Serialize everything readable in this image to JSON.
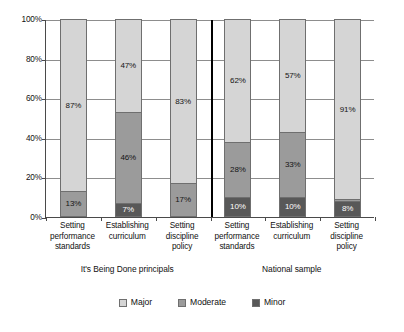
{
  "chart_data": {
    "type": "bar",
    "subtype": "stacked-100-percent",
    "title": "",
    "xlabel": "",
    "ylabel": "",
    "ylim": [
      0,
      100
    ],
    "ytick_labels": [
      "0%",
      "20%",
      "40%",
      "60%",
      "80%",
      "100%"
    ],
    "ytick_values": [
      0,
      20,
      40,
      60,
      80,
      100
    ],
    "grid": true,
    "legend_position": "bottom-center",
    "categories": [
      "Setting performance standards",
      "Establishing curriculum",
      "Setting discipline policy",
      "Setting performance standards",
      "Establishing curriculum",
      "Setting discipline policy"
    ],
    "groups": [
      {
        "label": "It's Being Done principals",
        "categories": [
          "Setting performance standards",
          "Establishing curriculum",
          "Setting discipline policy"
        ]
      },
      {
        "label": "National sample",
        "categories": [
          "Setting performance standards",
          "Establishing curriculum",
          "Setting discipline policy"
        ]
      }
    ],
    "series": [
      {
        "name": "Major",
        "color": "#d5d5d5",
        "values": [
          87,
          47,
          83,
          62,
          57,
          91
        ],
        "labels": [
          "87%",
          "47%",
          "83%",
          "62%",
          "57%",
          "91%"
        ]
      },
      {
        "name": "Moderate",
        "color": "#9b9b9b",
        "values": [
          13,
          46,
          17,
          28,
          33,
          1
        ],
        "labels": [
          "13%",
          "46%",
          "17%",
          "28%",
          "33%",
          ""
        ]
      },
      {
        "name": "Minor",
        "color": "#585858",
        "values": [
          0,
          7,
          0,
          10,
          10,
          8
        ],
        "labels": [
          "",
          "7%",
          "",
          "10%",
          "10%",
          "8%"
        ]
      }
    ],
    "legend": [
      {
        "label": "Major",
        "color": "#d5d5d5"
      },
      {
        "label": "Moderate",
        "color": "#9b9b9b"
      },
      {
        "label": "Minor",
        "color": "#585858"
      }
    ],
    "bars": [
      {
        "group": "It's Being Done principals",
        "category_lines": [
          "Setting",
          "performance",
          "standards"
        ],
        "segments": [
          {
            "series": "Minor",
            "value": 0,
            "label": ""
          },
          {
            "series": "Moderate",
            "value": 13,
            "label": "13%"
          },
          {
            "series": "Major",
            "value": 87,
            "label": "87%"
          }
        ]
      },
      {
        "group": "It's Being Done principals",
        "category_lines": [
          "Establishing",
          "curriculum"
        ],
        "segments": [
          {
            "series": "Minor",
            "value": 7,
            "label": "7%"
          },
          {
            "series": "Moderate",
            "value": 46,
            "label": "46%"
          },
          {
            "series": "Major",
            "value": 47,
            "label": "47%"
          }
        ]
      },
      {
        "group": "It's Being Done principals",
        "category_lines": [
          "Setting",
          "discipline",
          "policy"
        ],
        "segments": [
          {
            "series": "Minor",
            "value": 0,
            "label": ""
          },
          {
            "series": "Moderate",
            "value": 17,
            "label": "17%"
          },
          {
            "series": "Major",
            "value": 83,
            "label": "83%"
          }
        ]
      },
      {
        "group": "National sample",
        "category_lines": [
          "Setting",
          "performance",
          "standards"
        ],
        "segments": [
          {
            "series": "Minor",
            "value": 10,
            "label": "10%"
          },
          {
            "series": "Moderate",
            "value": 28,
            "label": "28%"
          },
          {
            "series": "Major",
            "value": 62,
            "label": "62%"
          }
        ]
      },
      {
        "group": "National sample",
        "category_lines": [
          "Establishing",
          "curriculum"
        ],
        "segments": [
          {
            "series": "Minor",
            "value": 10,
            "label": "10%"
          },
          {
            "series": "Moderate",
            "value": 33,
            "label": "33%"
          },
          {
            "series": "Major",
            "value": 57,
            "label": "57%"
          }
        ]
      },
      {
        "group": "National sample",
        "category_lines": [
          "Setting",
          "discipline",
          "policy"
        ],
        "segments": [
          {
            "series": "Minor",
            "value": 8,
            "label": "8%"
          },
          {
            "series": "Moderate",
            "value": 1,
            "label": ""
          },
          {
            "series": "Major",
            "value": 91,
            "label": "91%"
          }
        ]
      }
    ]
  }
}
